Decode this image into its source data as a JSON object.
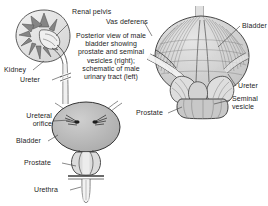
{
  "figure": {
    "background_color": "#ffffff",
    "ink_color": "#1d1d1d",
    "fill_gray": "#b8b8b8",
    "light_gray": "#d8d8d8"
  },
  "caption": {
    "text": "Posterior view of male bladder showing prostate and seminal vesicles (right); schematic of male urinary tract (left)"
  },
  "left_panel": {
    "name": "schematic-male-urinary-tract",
    "labels": {
      "renal_pelvis": "Renal pelvis",
      "kidney": "Kidney",
      "ureter": "Ureter",
      "ureteral_orifice": "Ureteral orifice",
      "bladder": "Bladder",
      "prostate": "Prostate",
      "urethra": "Urethra"
    }
  },
  "right_panel": {
    "name": "posterior-view-male-bladder",
    "labels": {
      "vas_deferens": "Vas deferens",
      "bladder": "Bladder",
      "ureter": "Ureter",
      "seminal_vesicle": "Seminal vesicle",
      "prostate": "Prostate"
    }
  }
}
